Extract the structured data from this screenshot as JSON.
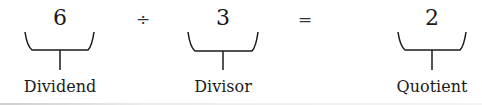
{
  "equation": {
    "dividend": {
      "value": "6",
      "label": "Dividend"
    },
    "operator_divide": "÷",
    "divisor": {
      "value": "3",
      "label": "Divisor"
    },
    "operator_equals": "=",
    "quotient": {
      "value": "2",
      "label": "Quotient"
    }
  },
  "colors": {
    "ink": "#1a1a1a",
    "background": "#ffffff"
  }
}
